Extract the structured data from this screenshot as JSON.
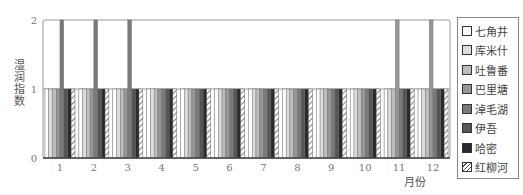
{
  "chart_data": {
    "type": "bar",
    "title": "",
    "xlabel": "月份",
    "ylabel": "湿润指数",
    "ylim": [
      0,
      2
    ],
    "yticks": [
      "0",
      "1",
      "2"
    ],
    "grid": false,
    "legend_position": "right",
    "categories": [
      "1",
      "2",
      "3",
      "4",
      "5",
      "6",
      "7",
      "8",
      "9",
      "10",
      "11",
      "12"
    ],
    "series": [
      {
        "name": "七角井",
        "color": "#ffffff",
        "values": [
          1,
          1,
          1,
          1,
          1,
          1,
          1,
          1,
          1,
          1,
          1,
          1
        ]
      },
      {
        "name": "库米什",
        "color": "#dcdcdc",
        "values": [
          1,
          1,
          1,
          1,
          1,
          1,
          1,
          1,
          1,
          1,
          1,
          1
        ]
      },
      {
        "name": "吐鲁番",
        "color": "#bdbdbd",
        "values": [
          1,
          1,
          1,
          1,
          1,
          1,
          1,
          1,
          1,
          1,
          1,
          1
        ]
      },
      {
        "name": "巴里塘",
        "color": "#969696",
        "values": [
          1,
          1,
          1,
          1,
          1,
          1,
          1,
          1,
          1,
          1,
          2,
          2
        ]
      },
      {
        "name": "淖毛湖",
        "color": "#7a7a7a",
        "values": [
          2,
          2,
          2,
          1,
          1,
          1,
          1,
          1,
          1,
          1,
          1,
          1
        ]
      },
      {
        "name": "伊吾",
        "color": "#555555",
        "values": [
          1,
          1,
          1,
          1,
          1,
          1,
          1,
          1,
          1,
          1,
          1,
          1
        ]
      },
      {
        "name": "哈密",
        "color": "#2a2a2a",
        "values": [
          1,
          1,
          1,
          1,
          1,
          1,
          1,
          1,
          1,
          1,
          1,
          1
        ]
      },
      {
        "name": "红柳河",
        "color": "hatch",
        "values": [
          1,
          1,
          1,
          1,
          1,
          1,
          1,
          1,
          1,
          1,
          1,
          1
        ]
      }
    ]
  },
  "legend": {
    "items": [
      {
        "label": "七角井"
      },
      {
        "label": "库米什"
      },
      {
        "label": "吐鲁番"
      },
      {
        "label": "巴里塘"
      },
      {
        "label": "淖毛湖"
      },
      {
        "label": "伊吾"
      },
      {
        "label": "哈密"
      },
      {
        "label": "红柳河"
      }
    ]
  },
  "axes": {
    "xlabel": "月份",
    "ylabel": "湿润指数"
  }
}
